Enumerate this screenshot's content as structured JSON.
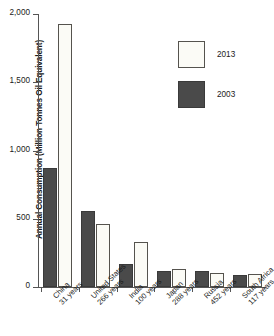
{
  "chart_data": {
    "type": "bar",
    "title": "",
    "xlabel": "",
    "ylabel": "Annual Consumption (Million Tonnes Oil Equivalent)",
    "ylim": [
      0,
      2000
    ],
    "yticks": [
      "0",
      "500",
      "1,000",
      "1,500",
      "2,000"
    ],
    "ytick_values": [
      0,
      500,
      1000,
      1500,
      2000
    ],
    "grid": false,
    "legend_position": "upper-right",
    "categories": [
      "China",
      "United States",
      "India",
      "Japan",
      "Russia",
      "South Africa"
    ],
    "category_sublabels": [
      "31 years",
      "266 years",
      "100 years",
      "288 years",
      "452 years",
      "117 years"
    ],
    "series": [
      {
        "name": "2003",
        "color": "#4a4a4a",
        "values": [
          870,
          560,
          165,
          115,
          115,
          90
        ]
      },
      {
        "name": "2013",
        "color": "#fbfbf6",
        "values": [
          1930,
          465,
          330,
          135,
          100,
          95
        ]
      }
    ]
  },
  "legend": {
    "items": [
      {
        "label": "2013",
        "swatch": "y2013"
      },
      {
        "label": "2003",
        "swatch": "y2003"
      }
    ]
  }
}
